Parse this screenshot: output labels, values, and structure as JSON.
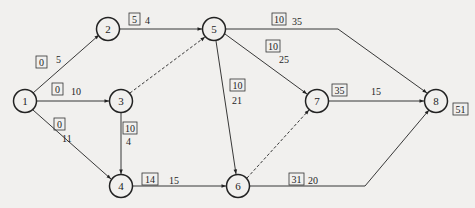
{
  "diagram": {
    "type": "activity-on-arrow network",
    "colors": {
      "background": "#f1f0ee",
      "stroke": "#222222",
      "text": "#1e1e1e"
    },
    "nodes": [
      {
        "id": "1",
        "label": "1",
        "x": 25,
        "y": 101
      },
      {
        "id": "2",
        "label": "2",
        "x": 108,
        "y": 29
      },
      {
        "id": "3",
        "label": "3",
        "x": 121,
        "y": 101
      },
      {
        "id": "4",
        "label": "4",
        "x": 121,
        "y": 186
      },
      {
        "id": "5",
        "label": "5",
        "x": 214,
        "y": 29
      },
      {
        "id": "6",
        "label": "6",
        "x": 238,
        "y": 186
      },
      {
        "id": "7",
        "label": "7",
        "x": 317,
        "y": 101
      },
      {
        "id": "8",
        "label": "8",
        "x": 436,
        "y": 101
      }
    ],
    "edges": [
      {
        "from": "1",
        "to": "2",
        "duration": "5",
        "boxed": "0",
        "dashed": false
      },
      {
        "from": "1",
        "to": "3",
        "duration": "10",
        "boxed": "0",
        "dashed": false
      },
      {
        "from": "1",
        "to": "4",
        "duration": "11",
        "boxed": "0",
        "dashed": false
      },
      {
        "from": "2",
        "to": "5",
        "duration": "4",
        "boxed": "5",
        "dashed": false
      },
      {
        "from": "3",
        "to": "5",
        "duration": "",
        "boxed": "",
        "dashed": true
      },
      {
        "from": "3",
        "to": "4",
        "duration": "4",
        "boxed": "10",
        "dashed": false
      },
      {
        "from": "4",
        "to": "6",
        "duration": "15",
        "boxed": "14",
        "dashed": false
      },
      {
        "from": "5",
        "to": "8",
        "duration": "35",
        "boxed": "10",
        "dashed": false
      },
      {
        "from": "5",
        "to": "7",
        "duration": "25",
        "boxed": "10",
        "dashed": false
      },
      {
        "from": "5",
        "to": "6",
        "duration": "21",
        "boxed": "10",
        "dashed": false
      },
      {
        "from": "6",
        "to": "7",
        "duration": "",
        "boxed": "",
        "dashed": true
      },
      {
        "from": "6",
        "to": "8",
        "duration": "20",
        "boxed": "31",
        "dashed": false
      },
      {
        "from": "7",
        "to": "8",
        "duration": "15",
        "boxed": "35",
        "dashed": false
      }
    ],
    "end_node_boxed": {
      "node": "8",
      "value": "51"
    }
  },
  "labels": {
    "n1": "1",
    "n2": "2",
    "n3": "3",
    "n4": "4",
    "n5": "5",
    "n6": "6",
    "n7": "7",
    "n8": "8",
    "e12_box": "0",
    "e12_dur": "5",
    "e13_box": "0",
    "e13_dur": "10",
    "e14_box": "0",
    "e14_dur": "11",
    "e25_box": "5",
    "e25_dur": "4",
    "e34_box": "10",
    "e34_dur": "4",
    "e46_box": "14",
    "e46_dur": "15",
    "e58_box": "10",
    "e58_dur": "35",
    "e57_box": "10",
    "e57_dur": "25",
    "e56_box": "10",
    "e56_dur": "21",
    "e68_box": "31",
    "e68_dur": "20",
    "e78_box": "35",
    "e78_dur": "15",
    "n8_box": "51"
  }
}
